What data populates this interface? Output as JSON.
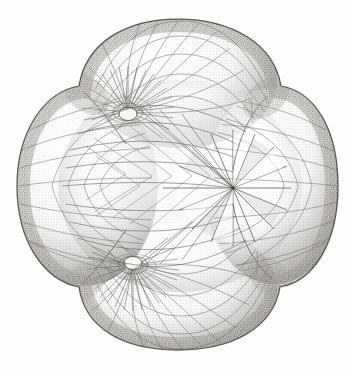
{
  "figure": {
    "medium": "stipple / halftone line engraving on paper",
    "caption": "",
    "ghost_text": "Die mathematischen Modelle der Flaechen"
  },
  "colors": {
    "paper": "#fdfdfc",
    "ink_dark": "#4a4641",
    "ink_mid": "#7d7872",
    "ink_light": "#b2aca4",
    "stipple": "#8d8880",
    "highlight": "#f7f6f3",
    "rim_shadow": "#5d5852"
  },
  "geometry": {
    "canvas": {
      "width": 353,
      "height": 373
    },
    "center": {
      "x": 178,
      "y": 186
    },
    "silhouette": {
      "description": "four-lobed clover outline with shallow saddles between lobes",
      "bounds": {
        "left": 17,
        "top": 19,
        "right": 338,
        "bottom": 350
      },
      "lobes": [
        {
          "name": "top-lobe",
          "cx": 181,
          "cy": 78,
          "rx": 92,
          "ry": 62
        },
        {
          "name": "right-lobe",
          "cx": 272,
          "cy": 186,
          "rx": 66,
          "ry": 92
        },
        {
          "name": "bottom-lobe",
          "cx": 181,
          "cy": 291,
          "rx": 92,
          "ry": 62
        },
        {
          "name": "left-lobe",
          "cx": 86,
          "cy": 186,
          "rx": 70,
          "ry": 94
        }
      ],
      "saddles": [
        {
          "name": "saddle-top-right",
          "x": 268,
          "y": 96
        },
        {
          "name": "saddle-bottom-right",
          "x": 272,
          "y": 279
        },
        {
          "name": "saddle-bottom-left",
          "x": 82,
          "y": 284
        },
        {
          "name": "saddle-top-left",
          "x": 84,
          "y": 92
        }
      ]
    },
    "singular_points": [
      {
        "name": "conical-point-upper",
        "x": 128,
        "y": 112,
        "type": "conical node",
        "fan_rays": 34
      },
      {
        "name": "conical-point-lower",
        "x": 133,
        "y": 265,
        "type": "conical node",
        "fan_rays": 34
      },
      {
        "name": "radial-star-node",
        "x": 233,
        "y": 188,
        "type": "umbilic / star vertex",
        "fan_rays": 16
      }
    ],
    "mesh": {
      "type": "curvilinear quadrilateral net",
      "meridians": 22,
      "parallels": 15,
      "shading": "cross-hatch stipple, darkest at silhouette rim"
    }
  },
  "labels": {
    "figure_number": "",
    "axis_labels": [],
    "annotations": []
  }
}
